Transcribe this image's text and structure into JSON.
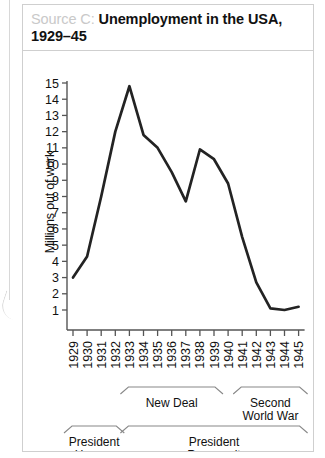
{
  "figure": {
    "source_label": "Source C:",
    "title": "Unemployment in the USA, 1929–45"
  },
  "chart_data": {
    "type": "line",
    "title": "Unemployment in the USA, 1929–45",
    "xlabel": "",
    "ylabel": "Millions out of work",
    "x": [
      1929,
      1930,
      1931,
      1932,
      1933,
      1934,
      1935,
      1936,
      1937,
      1938,
      1939,
      1940,
      1941,
      1942,
      1943,
      1944,
      1945
    ],
    "categories": [
      "1929",
      "1930",
      "1931",
      "1932",
      "1933",
      "1934",
      "1935",
      "1936",
      "1937",
      "1938",
      "1939",
      "1940",
      "1941",
      "1942",
      "1943",
      "1944",
      "1945"
    ],
    "values": [
      3.0,
      4.3,
      8.0,
      12.0,
      14.8,
      11.8,
      11.0,
      9.5,
      7.7,
      10.9,
      10.3,
      8.8,
      5.5,
      2.7,
      1.1,
      1.0,
      1.2
    ],
    "ylim": [
      0,
      15
    ],
    "yticks": [
      1,
      2,
      3,
      4,
      5,
      6,
      7,
      8,
      9,
      10,
      11,
      12,
      13,
      14,
      15
    ],
    "ytick_labels": [
      "1",
      "2",
      "3",
      "4",
      "5",
      "6",
      "7",
      "8",
      "9",
      "10",
      "11",
      "12",
      "13",
      "14",
      "15"
    ],
    "grid": false,
    "legend": false,
    "line_color": "#232323",
    "annotations": [
      {
        "name": "new-deal",
        "label": "New Deal",
        "label_lines": [
          "New Deal"
        ],
        "start": 1933,
        "end": 1939,
        "row": 1
      },
      {
        "name": "second-world-war",
        "label": "Second World War",
        "label_lines": [
          "Second",
          "World War"
        ],
        "start": 1941,
        "end": 1945,
        "row": 1
      },
      {
        "name": "president-hoover",
        "label": "President Hoover",
        "label_lines": [
          "President",
          "Hoover"
        ],
        "start": 1929,
        "end": 1932,
        "row": 2
      },
      {
        "name": "president-roosevelt",
        "label": "President Roosevelt",
        "label_lines": [
          "President",
          "Roosevelt"
        ],
        "start": 1933,
        "end": 1945,
        "row": 2
      }
    ]
  }
}
